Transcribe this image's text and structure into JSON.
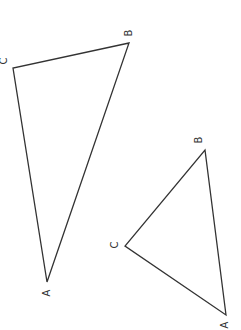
{
  "diagram": {
    "triangles": [
      {
        "name": "triangle-1",
        "vertices": {
          "A": {
            "x": 47,
            "y": 282,
            "label": "A",
            "lx": 47,
            "ly": 293
          },
          "B": {
            "x": 129,
            "y": 43,
            "label": "B",
            "lx": 129,
            "ly": 33
          },
          "C": {
            "x": 13,
            "y": 68,
            "label": "C",
            "lx": 4,
            "ly": 61
          }
        }
      },
      {
        "name": "triangle-2",
        "vertices": {
          "A": {
            "x": 226,
            "y": 315,
            "label": "A",
            "lx": 225,
            "ly": 325
          },
          "B": {
            "x": 205,
            "y": 150,
            "label": "B",
            "lx": 199,
            "ly": 140
          },
          "C": {
            "x": 125,
            "y": 246,
            "label": "C",
            "lx": 115,
            "ly": 245
          }
        }
      }
    ],
    "stroke_color": "#333333",
    "label_rotation_deg": -90
  }
}
